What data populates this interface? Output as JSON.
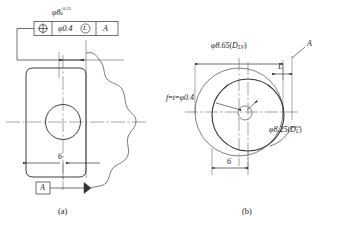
{
  "figure": {
    "title_a": "(a)",
    "title_b": "(b)"
  },
  "left_view": {
    "dimension_above": {
      "symbol": "φ8",
      "upper_tolerance": "+0.25",
      "lower_tolerance": "0"
    },
    "feature_control_frame": {
      "geometric_symbol": "position-symbol",
      "tolerance_value": "φ0.4",
      "material_condition": "L",
      "datum_reference": "A"
    },
    "width_dimension": "6",
    "datum_feature_label": "A"
  },
  "right_view": {
    "outer_diameter_label": "φ8.65",
    "outer_diameter_symbol": "D",
    "outer_diameter_subscript": "LV",
    "inner_diameter_label": "φ8.25",
    "inner_diameter_symbol": "D",
    "inner_diameter_subscript": "L",
    "tolerance_note_prefix": "f",
    "tolerance_note_middle": "t",
    "tolerance_note_value": "φ0.4",
    "offset_label": "L",
    "datum_label": "A",
    "width_dimension": "6"
  },
  "colors": {
    "line": "#333333",
    "thin_line": "#555555",
    "center_line": "#666666",
    "background": "#ffffff",
    "text": "#1a1a1a"
  }
}
